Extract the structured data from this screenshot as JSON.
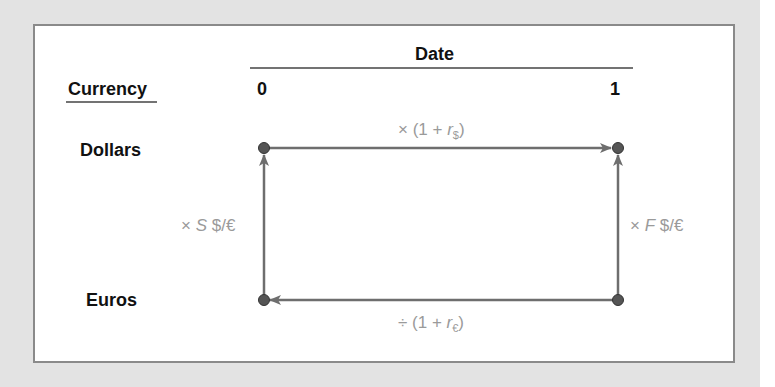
{
  "header": {
    "date_label": "Date",
    "currency_label": "Currency",
    "date_0": "0",
    "date_1": "1"
  },
  "rows": {
    "dollars": "Dollars",
    "euros": "Euros"
  },
  "operations": {
    "top": {
      "prefix": "× (1 + ",
      "var": "r",
      "sub": "$",
      "suffix": ")"
    },
    "bottom": {
      "prefix": "÷ (1 + ",
      "var": "r",
      "sub": "€",
      "suffix": ")"
    },
    "left": {
      "prefix": "× ",
      "var": "S",
      "suffix": " $/€"
    },
    "right": {
      "prefix": "× ",
      "var": "F",
      "suffix": " $/€"
    }
  },
  "colors": {
    "line": "#6e6e6e",
    "node": "#555555",
    "op_text": "#9a9a9a",
    "background": "#e3e3e3"
  }
}
